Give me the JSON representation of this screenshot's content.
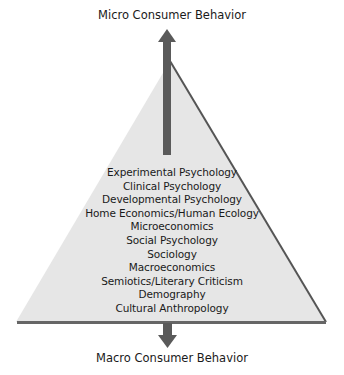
{
  "diagram": {
    "title_top": "Micro Consumer Behavior",
    "title_bottom": "Macro Consumer Behavior",
    "disciplines": [
      "Experimental Psychology",
      "Clinical Psychology",
      "Developmental Psychology",
      "Home Economics/Human Ecology",
      "Microeconomics",
      "Social Psychology",
      "Sociology",
      "Macroeconomics",
      "Semiotics/Literary Criticism",
      "Demography",
      "Cultural Anthropology"
    ],
    "colors": {
      "pyramid_fill": "#e6e6e6",
      "pyramid_edge": "#555555",
      "base_line": "#666666",
      "arrow": "#5a5a5a",
      "text": "#1a1a1a"
    },
    "icons": {
      "top_arrow": "arrow-up-icon",
      "bottom_arrow": "arrow-down-icon"
    }
  }
}
